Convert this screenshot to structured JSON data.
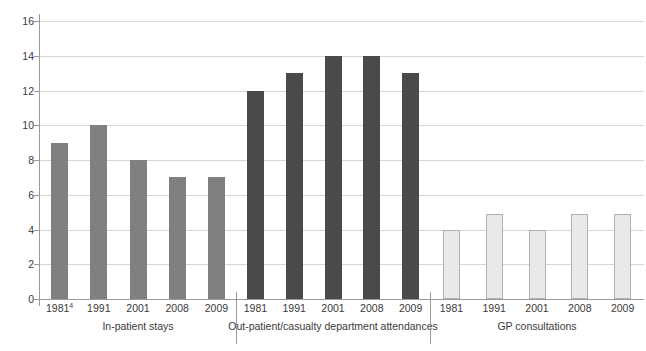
{
  "chart_data": {
    "type": "bar",
    "title": "",
    "subtitle": "",
    "xlabel": "",
    "ylabel": "",
    "ylim": [
      0,
      16
    ],
    "ytick_labels": [
      "0",
      "2",
      "4",
      "6",
      "8",
      "10",
      "12",
      "14",
      "16"
    ],
    "ytick_values": [
      0,
      2,
      4,
      6,
      8,
      10,
      12,
      14,
      16
    ],
    "grid": true,
    "legend": "none",
    "grouped": true,
    "groups": [
      {
        "name": "In-patient stays",
        "color": "#808080",
        "categories": [
          "1981",
          "1991",
          "2001",
          "2008",
          "2009"
        ],
        "category_labels": [
          "1981",
          "1991",
          "2001",
          "2008",
          "2009"
        ],
        "footnote_marks": [
          "4",
          "",
          "",
          "",
          ""
        ],
        "values": [
          9,
          10,
          8,
          7,
          7
        ]
      },
      {
        "name": "Out-patient/casualty department attendances",
        "color": "#4a4a4a",
        "categories": [
          "1981",
          "1991",
          "2001",
          "2008",
          "2009"
        ],
        "category_labels": [
          "1981",
          "1991",
          "2001",
          "2008",
          "2009"
        ],
        "footnote_marks": [
          "",
          "",
          "",
          "",
          ""
        ],
        "values": [
          12,
          13,
          14,
          14,
          13
        ]
      },
      {
        "name": "GP consultations",
        "color": "#e9e9e9",
        "categories": [
          "1981",
          "1991",
          "2001",
          "2008",
          "2009"
        ],
        "category_labels": [
          "1981",
          "1991",
          "2001",
          "2008",
          "2009"
        ],
        "footnote_marks": [
          "",
          "",
          "",
          "",
          ""
        ],
        "values": [
          4,
          4.9,
          4,
          4.9,
          4.9
        ]
      }
    ]
  },
  "colors": {
    "group1": "#808080",
    "group2": "#4a4a4a",
    "group3": "#e9e9e9",
    "group3_border": "#b0b0b0",
    "gridline": "#d6d6d6",
    "axis": "#9a9a9a",
    "text": "#3a3a3a",
    "background": "#ffffff"
  }
}
